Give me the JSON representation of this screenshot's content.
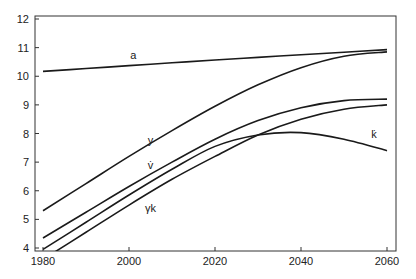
{
  "chart_data": {
    "type": "line",
    "title": "",
    "xlabel": "",
    "ylabel": "",
    "xlim": [
      1978,
      2062
    ],
    "ylim": [
      3.9,
      12.1
    ],
    "grid": false,
    "legend": "inline labels",
    "x_ticks": [
      "1980",
      "2000",
      "2020",
      "2040",
      "2060"
    ],
    "y_ticks": [
      "4",
      "5",
      "6",
      "7",
      "8",
      "9",
      "10",
      "11",
      "12"
    ],
    "x": [
      1980,
      1990,
      2000,
      2010,
      2020,
      2030,
      2040,
      2050,
      2060
    ],
    "series": [
      {
        "name": "a",
        "label": "a",
        "values": [
          10.17,
          10.27,
          10.37,
          10.47,
          10.57,
          10.66,
          10.75,
          10.84,
          10.93
        ]
      },
      {
        "name": "y",
        "label": "y",
        "values": [
          5.3,
          6.25,
          7.2,
          8.1,
          8.95,
          9.7,
          10.3,
          10.7,
          10.85
        ]
      },
      {
        "name": "v_dot",
        "label": "v̇",
        "values": [
          4.35,
          5.25,
          6.15,
          7.0,
          7.8,
          8.45,
          8.9,
          9.15,
          9.2
        ]
      },
      {
        "name": "k_dot",
        "label": "k̇",
        "values": [
          3.95,
          4.9,
          5.85,
          6.75,
          7.55,
          7.95,
          8.03,
          7.8,
          7.4
        ]
      },
      {
        "name": "gamma_k",
        "label": "γk",
        "values": [
          3.6,
          4.55,
          5.5,
          6.4,
          7.2,
          7.95,
          8.5,
          8.85,
          9.0
        ]
      }
    ],
    "annotations": [
      {
        "text": "a",
        "x": 2001,
        "y": 10.6
      },
      {
        "text": "y",
        "x": 2005,
        "y": 7.65
      },
      {
        "text": "v̇",
        "x": 2005,
        "y": 6.75
      },
      {
        "text": "k̇",
        "x": 2057,
        "y": 7.85
      },
      {
        "text": "γk",
        "x": 2005,
        "y": 5.25
      }
    ]
  }
}
